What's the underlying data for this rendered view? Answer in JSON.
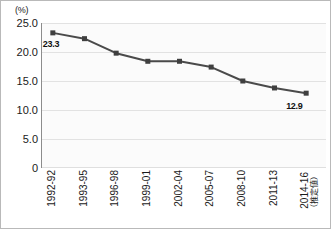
{
  "chart_data": {
    "type": "line",
    "title": "",
    "subtitle": "",
    "xlabel": "",
    "ylabel": "",
    "yunit": "(%)",
    "ylim": [
      0,
      25
    ],
    "yticks": [
      "0",
      "5.0",
      "10.0",
      "15.0",
      "20.0",
      "25.0"
    ],
    "ytick_values": [
      0,
      5,
      10,
      15,
      20,
      25
    ],
    "grid": true,
    "grid_axis": "y",
    "legend": false,
    "legend_position": "none",
    "marker": "square",
    "series_color": "#4a4a4a",
    "categories": [
      "1992-92",
      "1993-95",
      "1996-98",
      "1999-01",
      "2002-04",
      "2005-07",
      "2008-10",
      "2011-13",
      "2014-16"
    ],
    "category_sublabels": [
      "",
      "",
      "",
      "",
      "",
      "",
      "",
      "",
      "（推定値）"
    ],
    "values": [
      23.3,
      22.3,
      19.8,
      18.4,
      18.4,
      17.4,
      15.0,
      13.8,
      12.9
    ],
    "point_labels": [
      {
        "index": 0,
        "text": "23.3"
      },
      {
        "index": 8,
        "text": "12.9"
      }
    ]
  },
  "colors": {
    "line": "#4a4a4a",
    "marker": "#3f3f3f",
    "axis": "#8c8c8c",
    "grid": "#e2e2e2",
    "text": "#1a1a1a",
    "border": "#b9b9b9",
    "plot_background": "#fbfbfb"
  }
}
